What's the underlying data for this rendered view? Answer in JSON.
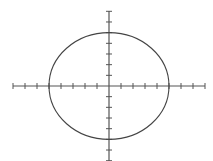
{
  "chart_data": {
    "type": "line",
    "title": "",
    "xlabel": "",
    "ylabel": "",
    "equation": "x^2 + y^2 = 25",
    "center": [
      0,
      0
    ],
    "radius_x": 5,
    "radius_y": 5,
    "xlim": [
      -8,
      8
    ],
    "ylim": [
      -7,
      7
    ],
    "x_ticks": [
      -8,
      -7,
      -6,
      -5,
      -4,
      -3,
      -2,
      -1,
      1,
      2,
      3,
      4,
      5,
      6,
      7,
      8
    ],
    "y_ticks": [
      -7,
      -6,
      -5,
      -4,
      -3,
      -2,
      -1,
      1,
      2,
      3,
      4,
      5,
      6,
      7
    ],
    "tick_labels_shown": false,
    "grid": false,
    "legend": null,
    "series": [
      {
        "name": "circle",
        "shape": "ellipse",
        "intercepts": {
          "x": [
            -5,
            5
          ],
          "y": [
            -5,
            5
          ]
        }
      }
    ]
  },
  "style": {
    "axis_color": "#555555",
    "curve_color": "#444444",
    "background": "#ffffff"
  },
  "layout": {
    "origin_px": [
      109,
      86
    ],
    "unit_x_px": 12,
    "unit_y_px": 10.67,
    "x_axis_px": [
      13,
      205
    ],
    "y_axis_px": [
      11,
      161
    ]
  }
}
